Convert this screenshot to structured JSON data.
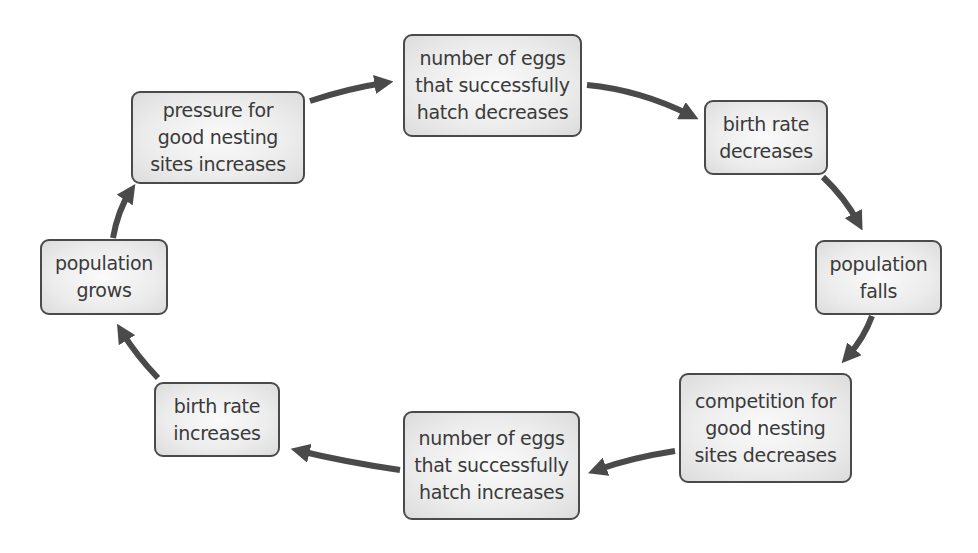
{
  "diagram": {
    "type": "cycle",
    "colors": {
      "arrow": "#4a4a4a",
      "box_border": "#4a4a4a",
      "box_fill": "#e8e8e8",
      "text": "#3a3a3a"
    },
    "nodes": [
      {
        "id": "pressure",
        "lines": [
          "pressure for",
          "good nesting",
          "sites increases"
        ]
      },
      {
        "id": "eggs-decrease",
        "lines": [
          "number of eggs",
          "that successfully",
          "hatch decreases"
        ]
      },
      {
        "id": "birth-decrease",
        "lines": [
          "birth rate",
          "decreases"
        ]
      },
      {
        "id": "pop-falls",
        "lines": [
          "population",
          "falls"
        ]
      },
      {
        "id": "competition",
        "lines": [
          "competition for",
          "good nesting",
          "sites decreases"
        ]
      },
      {
        "id": "eggs-increase",
        "lines": [
          "number of eggs",
          "that successfully",
          "hatch increases"
        ]
      },
      {
        "id": "birth-increase",
        "lines": [
          "birth rate",
          "increases"
        ]
      },
      {
        "id": "pop-grows",
        "lines": [
          "population",
          "grows"
        ]
      }
    ],
    "edges": [
      {
        "from": "pressure",
        "to": "eggs-decrease"
      },
      {
        "from": "eggs-decrease",
        "to": "birth-decrease"
      },
      {
        "from": "birth-decrease",
        "to": "pop-falls"
      },
      {
        "from": "pop-falls",
        "to": "competition"
      },
      {
        "from": "competition",
        "to": "eggs-increase"
      },
      {
        "from": "eggs-increase",
        "to": "birth-increase"
      },
      {
        "from": "birth-increase",
        "to": "pop-grows"
      },
      {
        "from": "pop-grows",
        "to": "pressure"
      }
    ]
  }
}
